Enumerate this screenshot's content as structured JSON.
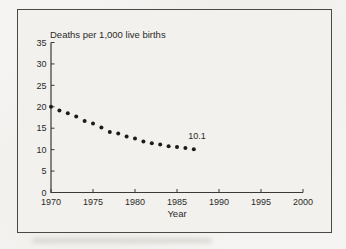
{
  "figure": {
    "title": "Deaths per 1,000 live births",
    "xlabel": "Year",
    "annotation_text": "10.1"
  },
  "chart_data": {
    "type": "scatter",
    "title": "Deaths per 1,000 live births",
    "xlabel": "Year",
    "ylabel": "Deaths per 1,000 live births",
    "x": [
      1970,
      1971,
      1972,
      1973,
      1974,
      1975,
      1976,
      1977,
      1978,
      1979,
      1980,
      1981,
      1982,
      1983,
      1984,
      1985,
      1986,
      1987
    ],
    "y": [
      20.0,
      19.1,
      18.5,
      17.7,
      16.7,
      16.1,
      15.2,
      14.1,
      13.8,
      13.1,
      12.6,
      11.9,
      11.5,
      11.2,
      10.8,
      10.6,
      10.4,
      10.1
    ],
    "xlim": [
      1970,
      2000
    ],
    "ylim": [
      0,
      35
    ],
    "x_ticks": [
      1970,
      1975,
      1980,
      1985,
      1990,
      1995,
      2000
    ],
    "y_ticks": [
      0,
      5,
      10,
      15,
      20,
      25,
      30,
      35
    ],
    "grid": false,
    "legend": false,
    "annotation": {
      "text": "10.1",
      "x": 1987,
      "y": 10.1
    },
    "marker_color": "#1c1b1a",
    "axis_color": "#3a3936"
  }
}
